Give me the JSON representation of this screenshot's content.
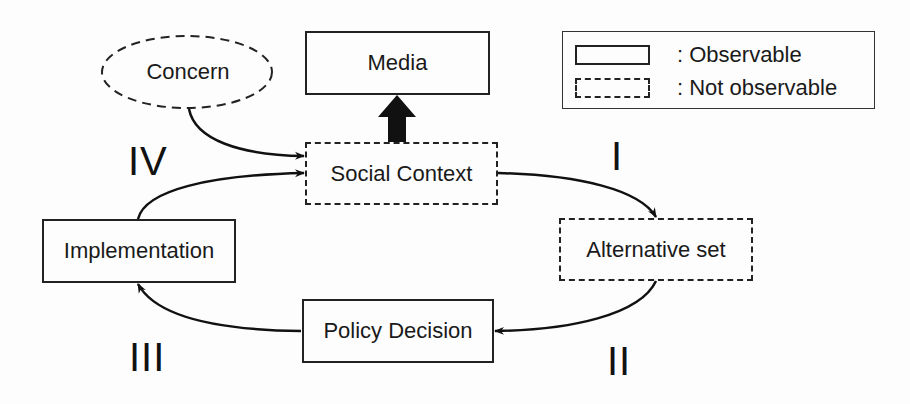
{
  "diagram": {
    "nodes": {
      "concern": {
        "label": "Concern",
        "style": "dashed-ellipse"
      },
      "media": {
        "label": "Media",
        "style": "solid"
      },
      "social_context": {
        "label": "Social Context",
        "style": "dashed"
      },
      "alternative_set": {
        "label": "Alternative set",
        "style": "dashed"
      },
      "policy_decision": {
        "label": "Policy Decision",
        "style": "solid"
      },
      "implementation": {
        "label": "Implementation",
        "style": "solid"
      }
    },
    "edges": [
      {
        "from": "concern",
        "to": "social_context"
      },
      {
        "from": "social_context",
        "to": "media",
        "style": "thick"
      },
      {
        "from": "social_context",
        "to": "alternative_set",
        "phase": "I"
      },
      {
        "from": "alternative_set",
        "to": "policy_decision",
        "phase": "II"
      },
      {
        "from": "policy_decision",
        "to": "implementation",
        "phase": "III"
      },
      {
        "from": "implementation",
        "to": "social_context",
        "phase": "IV"
      }
    ],
    "phases": {
      "i": "I",
      "ii": "II",
      "iii": "III",
      "iv": "IV"
    }
  },
  "legend": {
    "observable": ": Observable",
    "not_observable": ": Not observable"
  }
}
